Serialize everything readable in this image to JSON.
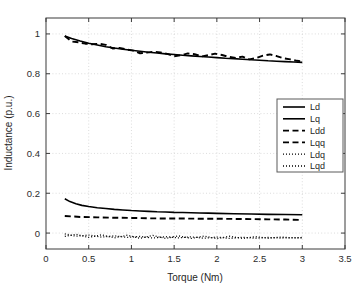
{
  "figure": {
    "caption": ""
  },
  "chart_data": {
    "type": "line",
    "title": "",
    "xlabel": "Torque (Nm)",
    "ylabel": "Inductance (p.u.)",
    "xlim": [
      0,
      3.5
    ],
    "ylim": [
      -0.08,
      1.08
    ],
    "xticks": [
      "0",
      "0.5",
      "1",
      "1.5",
      "2",
      "2.5",
      "3",
      "3.5"
    ],
    "xtick_values": [
      0,
      0.5,
      1,
      1.5,
      2,
      2.5,
      3,
      3.5
    ],
    "yticks": [
      "0",
      "0.2",
      "0.4",
      "0.6",
      "0.8",
      "1"
    ],
    "ytick_values": [
      0,
      0.2,
      0.4,
      0.6,
      0.8,
      1
    ],
    "grid": true,
    "grid_style": "dotted",
    "grid_color": "#d8d8d8",
    "legend_position": "center-right",
    "line_color": "#000000",
    "series": [
      {
        "name": "Ld",
        "style": "solid",
        "x": [
          0.22,
          0.3,
          0.4,
          0.5,
          0.6,
          0.7,
          0.8,
          0.9,
          1.0,
          1.1,
          1.2,
          1.3,
          1.4,
          1.5,
          1.6,
          1.7,
          1.8,
          1.9,
          2.0,
          2.1,
          2.2,
          2.3,
          2.4,
          2.5,
          2.6,
          2.7,
          2.8,
          2.9,
          3.0
        ],
        "values": [
          0.99,
          0.977,
          0.964,
          0.953,
          0.944,
          0.936,
          0.929,
          0.923,
          0.918,
          0.913,
          0.908,
          0.904,
          0.9,
          0.897,
          0.893,
          0.89,
          0.887,
          0.884,
          0.881,
          0.878,
          0.876,
          0.873,
          0.87,
          0.868,
          0.865,
          0.863,
          0.861,
          0.859,
          0.857
        ]
      },
      {
        "name": "Lq",
        "style": "solid",
        "x": [
          0.22,
          0.28,
          0.35,
          0.42,
          0.5,
          0.6,
          0.7,
          0.8,
          0.9,
          1.0,
          1.1,
          1.2,
          1.3,
          1.4,
          1.5,
          1.6,
          1.7,
          1.8,
          1.9,
          2.0,
          2.2,
          2.4,
          2.6,
          2.8,
          3.0
        ],
        "values": [
          0.172,
          0.158,
          0.147,
          0.139,
          0.133,
          0.127,
          0.123,
          0.119,
          0.116,
          0.113,
          0.111,
          0.109,
          0.107,
          0.106,
          0.104,
          0.103,
          0.102,
          0.101,
          0.1,
          0.099,
          0.097,
          0.096,
          0.094,
          0.093,
          0.092
        ]
      },
      {
        "name": "Ldd",
        "style": "dashed",
        "x": [
          0.22,
          0.3,
          0.38,
          0.46,
          0.54,
          0.62,
          0.7,
          0.78,
          0.86,
          0.94,
          1.02,
          1.1,
          1.18,
          1.26,
          1.34,
          1.42,
          1.5,
          1.58,
          1.66,
          1.74,
          1.82,
          1.9,
          1.98,
          2.06,
          2.14,
          2.22,
          2.3,
          2.38,
          2.46,
          2.54,
          2.62,
          2.7,
          2.78,
          2.86,
          2.94,
          3.0
        ],
        "values": [
          0.989,
          0.962,
          0.958,
          0.951,
          0.948,
          0.951,
          0.945,
          0.927,
          0.93,
          0.922,
          0.916,
          0.903,
          0.906,
          0.911,
          0.907,
          0.9,
          0.888,
          0.893,
          0.902,
          0.898,
          0.887,
          0.893,
          0.901,
          0.894,
          0.885,
          0.879,
          0.886,
          0.872,
          0.879,
          0.891,
          0.897,
          0.889,
          0.878,
          0.872,
          0.865,
          0.862
        ]
      },
      {
        "name": "Lqq",
        "style": "dashed",
        "x": [
          0.22,
          0.4,
          0.6,
          0.8,
          1.0,
          1.2,
          1.4,
          1.6,
          1.8,
          2.0,
          2.2,
          2.4,
          2.6,
          2.8,
          3.0
        ],
        "values": [
          0.086,
          0.081,
          0.079,
          0.077,
          0.076,
          0.074,
          0.073,
          0.073,
          0.072,
          0.072,
          0.071,
          0.07,
          0.069,
          0.068,
          0.066
        ]
      },
      {
        "name": "Ldq",
        "style": "dotted",
        "x": [
          0.22,
          0.35,
          0.5,
          0.65,
          0.8,
          0.95,
          1.1,
          1.25,
          1.4,
          1.55,
          1.7,
          1.85,
          2.0,
          2.15,
          2.3,
          2.45,
          2.6,
          2.75,
          2.9,
          3.0
        ],
        "values": [
          -0.004,
          -0.016,
          -0.01,
          -0.02,
          -0.014,
          -0.022,
          -0.017,
          -0.025,
          -0.018,
          -0.024,
          -0.019,
          -0.026,
          -0.02,
          -0.027,
          -0.021,
          -0.026,
          -0.022,
          -0.025,
          -0.023,
          -0.024
        ]
      },
      {
        "name": "Lqd",
        "style": "dotted",
        "x": [
          0.22,
          0.35,
          0.5,
          0.65,
          0.8,
          0.95,
          1.1,
          1.25,
          1.4,
          1.55,
          1.7,
          1.85,
          2.0,
          2.15,
          2.3,
          2.45,
          2.6,
          2.75,
          2.9,
          3.0
        ],
        "values": [
          -0.017,
          -0.006,
          -0.022,
          -0.009,
          -0.024,
          -0.011,
          -0.026,
          -0.012,
          -0.027,
          -0.014,
          -0.027,
          -0.015,
          -0.028,
          -0.016,
          -0.027,
          -0.018,
          -0.026,
          -0.02,
          -0.025,
          -0.022
        ]
      }
    ],
    "legend": [
      "Ld",
      "Lq",
      "Ldd",
      "Lqq",
      "Ldq",
      "Lqd"
    ]
  }
}
